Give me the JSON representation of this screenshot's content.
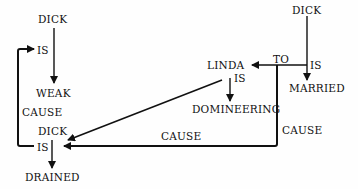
{
  "diagram": {
    "type": "conceptual-dependency",
    "nodes": {
      "dick1": "DICK",
      "weak": "WEAK",
      "dick2": "DICK",
      "drained": "DRAINED",
      "linda": "LINDA",
      "domineering": "DOMINEERING",
      "dick3": "DICK",
      "married": "MARRIED"
    },
    "links": {
      "is1": "IS",
      "is2": "IS",
      "is3": "IS",
      "is4": "IS",
      "to": "TO",
      "cause1": "CAUSE",
      "cause2": "CAUSE",
      "cause3": "CAUSE"
    },
    "colors": {
      "line": "#111111",
      "text": "#111111",
      "background": "#fefefe"
    }
  }
}
